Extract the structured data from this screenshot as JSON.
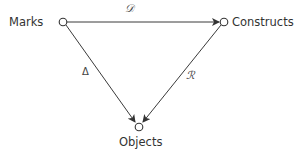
{
  "diagram": {
    "nodes": [
      {
        "id": "marks",
        "label": "Marks",
        "x": 63,
        "y": 22
      },
      {
        "id": "constructs",
        "label": "Constructs",
        "x": 224,
        "y": 22
      },
      {
        "id": "objects",
        "label": "Objects",
        "x": 139,
        "y": 127
      }
    ],
    "edges": [
      {
        "from": "marks",
        "to": "constructs",
        "label": "𝒟"
      },
      {
        "from": "marks",
        "to": "objects",
        "label": "Δ"
      },
      {
        "from": "constructs",
        "to": "objects",
        "label": "ℛ"
      }
    ],
    "colors": {
      "line": "#3a3a3a",
      "node_fill": "#ffffff"
    }
  }
}
